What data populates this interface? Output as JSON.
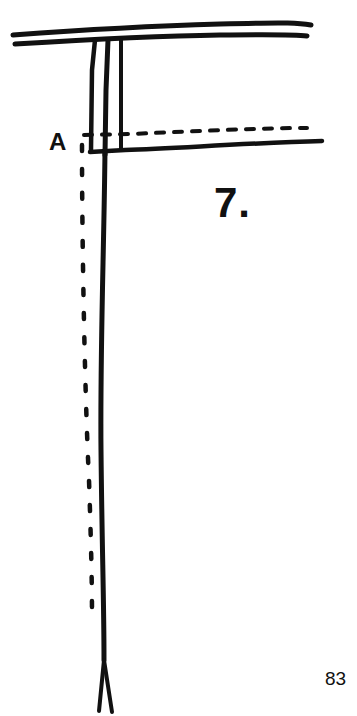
{
  "diagram": {
    "point_label": "A",
    "figure_number": "7.",
    "page_number": "83",
    "ink_color": "#111111",
    "background_color": "#ffffff"
  }
}
